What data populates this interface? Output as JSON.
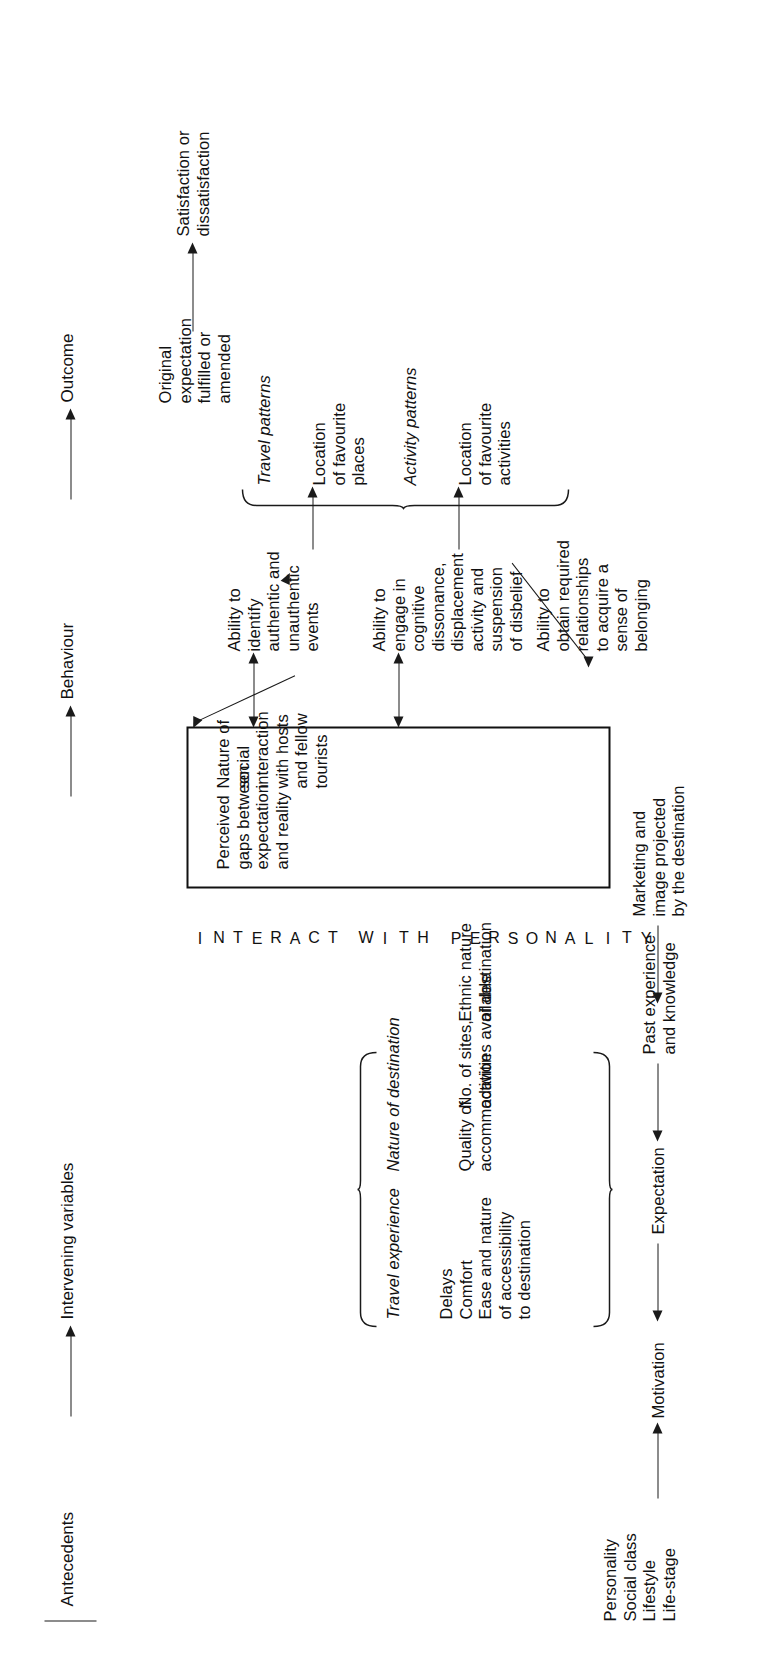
{
  "figure": {
    "type": "flow-diagram",
    "orientation": "rotated-90-ccw",
    "stages": [
      "Antecedents",
      "Intervening variables",
      "Behaviour",
      "Outcome"
    ]
  },
  "headers": {
    "antecedents": "Antecedents",
    "intervening": "Intervening variables",
    "behaviour": "Behaviour",
    "outcome": "Outcome"
  },
  "antecedents": {
    "traits": "Personality\nSocial class\nLifestyle\nLife-stage",
    "motivation": "Motivation",
    "expectation": "Expectation",
    "past_experience": "Past experience\nand knowledge",
    "marketing": "Marketing and\nimage projected\nby the destination"
  },
  "intervening": {
    "travel_experience_title": "Travel experience",
    "travel_experience_items": "Delays\nComfort\nEase and nature\nof accessibility\nto destination",
    "nature_of_destination_title": "Nature of destination",
    "quality_of_accommodation": "Quality of\naccommodation",
    "sites_activities": "No. of sites,\nactivities available",
    "ethnic_nature": "Ethnic nature\nof destination"
  },
  "interact_band": {
    "line1": "INTERACT",
    "line2": "WITH",
    "line3": "PERSONALITY"
  },
  "core_box": {
    "item1": "Perceived\ngaps between\nexpectation\nand reality",
    "item2": "Nature of\nsocial\ninteraction\nwith hosts\nand fellow\ntourists"
  },
  "abilities": {
    "identify": "Ability to\nidentify\nauthentic and\nunauthentic\nevents",
    "engage": "Ability to\nengage in\ncognitive\ndissonance,\ndisplacement\nactivity and\nsuspension\nof disbelief",
    "obtain": "Ability to\nobtain required\nrelationships\nto acquire a\nsense of\nbelonging"
  },
  "behaviour": {
    "travel_patterns_title": "Travel patterns",
    "travel_patterns_items": "Location\nof favourite\nplaces",
    "activity_patterns_title": "Activity patterns",
    "activity_patterns_items": "Location\nof favourite\nactivities"
  },
  "outcome": {
    "expectation_state": "Original\nexpectation\nfulfilled or\namended",
    "result": "Satisfaction or\ndissatisfaction"
  },
  "colors": {
    "ink": "#111111",
    "background": "#ffffff"
  }
}
